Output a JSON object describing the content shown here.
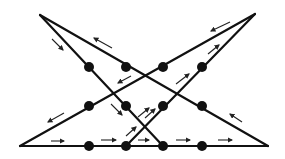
{
  "diagram": {
    "colors": {
      "stroke": "#111111",
      "dot": "#111111",
      "arrow": "#222222",
      "background": "#ffffff"
    },
    "vertices": {
      "top_left_apex": [
        40,
        15
      ],
      "top_right_apex": [
        255,
        14
      ],
      "bottom_left": [
        20,
        146
      ],
      "bottom_right": [
        268,
        146
      ]
    },
    "dots": [
      {
        "row": 1,
        "col": 1,
        "x": 89,
        "y": 67
      },
      {
        "row": 1,
        "col": 2,
        "x": 126,
        "y": 67
      },
      {
        "row": 1,
        "col": 3,
        "x": 163,
        "y": 67
      },
      {
        "row": 1,
        "col": 4,
        "x": 202,
        "y": 67
      },
      {
        "row": 2,
        "col": 1,
        "x": 89,
        "y": 106
      },
      {
        "row": 2,
        "col": 2,
        "x": 126,
        "y": 106
      },
      {
        "row": 2,
        "col": 3,
        "x": 163,
        "y": 106
      },
      {
        "row": 2,
        "col": 4,
        "x": 202,
        "y": 106
      },
      {
        "row": 3,
        "col": 1,
        "x": 89,
        "y": 146
      },
      {
        "row": 3,
        "col": 2,
        "x": 126,
        "y": 146
      },
      {
        "row": 3,
        "col": 3,
        "x": 163,
        "y": 146
      },
      {
        "row": 3,
        "col": 4,
        "x": 202,
        "y": 146
      }
    ],
    "segments": [
      {
        "name": "bottom-line",
        "from": [
          20,
          146
        ],
        "to": [
          268,
          146
        ]
      },
      {
        "name": "right-to-top-left-line",
        "from": [
          268,
          146
        ],
        "to": [
          40,
          15
        ]
      },
      {
        "name": "top-left-to-bottom-line",
        "from": [
          40,
          15
        ],
        "to": [
          163,
          146
        ]
      },
      {
        "name": "bottom-to-top-right-line",
        "from": [
          126,
          146
        ],
        "to": [
          255,
          14
        ]
      },
      {
        "name": "top-right-to-bottom-left-line",
        "from": [
          255,
          14
        ],
        "to": [
          20,
          146
        ]
      }
    ],
    "arrows": [
      {
        "from": [
          52,
          39
        ],
        "to": [
          63,
          50
        ],
        "direction": "down-right"
      },
      {
        "from": [
          112,
          48
        ],
        "to": [
          94,
          38
        ],
        "direction": "up-left"
      },
      {
        "from": [
          131,
          76
        ],
        "to": [
          118,
          83
        ],
        "direction": "down-left"
      },
      {
        "from": [
          176,
          84
        ],
        "to": [
          189,
          74
        ],
        "direction": "up-right"
      },
      {
        "from": [
          111,
          104
        ],
        "to": [
          122,
          115
        ],
        "direction": "down-right"
      },
      {
        "from": [
          145,
          118
        ],
        "to": [
          155,
          109
        ],
        "direction": "up-right"
      },
      {
        "from": [
          64,
          113
        ],
        "to": [
          48,
          122
        ],
        "direction": "down-left"
      },
      {
        "from": [
          51,
          141
        ],
        "to": [
          64,
          141
        ],
        "direction": "right"
      },
      {
        "from": [
          101,
          140
        ],
        "to": [
          116,
          140
        ],
        "direction": "right"
      },
      {
        "from": [
          126,
          136
        ],
        "to": [
          136,
          127
        ],
        "direction": "up-right"
      },
      {
        "from": [
          138,
          117
        ],
        "to": [
          149,
          108
        ],
        "direction": "up-right"
      },
      {
        "from": [
          138,
          140
        ],
        "to": [
          149,
          140
        ],
        "direction": "right"
      },
      {
        "from": [
          176,
          140
        ],
        "to": [
          190,
          140
        ],
        "direction": "right"
      },
      {
        "from": [
          218,
          140
        ],
        "to": [
          232,
          140
        ],
        "direction": "right"
      },
      {
        "from": [
          242,
          122
        ],
        "to": [
          230,
          114
        ],
        "direction": "up-left"
      },
      {
        "from": [
          230,
          22
        ],
        "to": [
          211,
          31
        ],
        "direction": "down-left"
      },
      {
        "from": [
          208,
          54
        ],
        "to": [
          219,
          45
        ],
        "direction": "up-right"
      }
    ]
  }
}
